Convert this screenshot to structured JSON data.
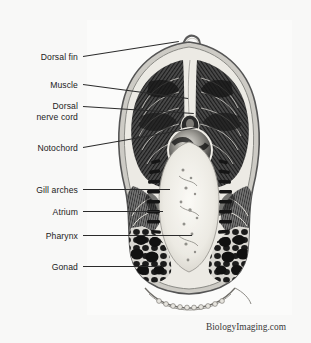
{
  "figure": {
    "title_credit": "BiologyImaging.com",
    "frame": {
      "x": 87,
      "y": 20,
      "width": 205,
      "height": 295,
      "border_color": "#8d8d8d"
    },
    "background_color": "#f8f8f7",
    "specimen_description": "amphioxus-cross-section"
  },
  "labels": [
    {
      "id": "dorsal-fin",
      "text": "Dorsal fin",
      "lines": [
        "Dorsal fin"
      ],
      "y": 52,
      "text_right": 78,
      "leader_x1": 83,
      "leader_y1": 56,
      "leader_x2": 179,
      "leader_y2": 41
    },
    {
      "id": "muscle",
      "text": "Muscle",
      "lines": [
        "Muscle"
      ],
      "y": 80,
      "text_right": 78,
      "leader_x1": 83,
      "leader_y1": 84,
      "leader_x2": 188,
      "leader_y2": 98
    },
    {
      "id": "dorsal-nerve-cord",
      "text": "Dorsal nerve cord",
      "lines": [
        "Dorsal",
        "nerve cord"
      ],
      "y": 101,
      "text_right": 78,
      "leader_x1": 83,
      "leader_y1": 106,
      "leader_x2": 194,
      "leader_y2": 113
    },
    {
      "id": "notochord",
      "text": "Notochord",
      "lines": [
        "Notochord"
      ],
      "y": 143,
      "text_right": 78,
      "leader_x1": 83,
      "leader_y1": 147,
      "leader_x2": 197,
      "leader_y2": 127
    },
    {
      "id": "gill-arches",
      "text": "Gill arches",
      "lines": [
        "Gill arches"
      ],
      "y": 185,
      "text_right": 78,
      "leader_x1": 83,
      "leader_y1": 189,
      "leader_x2": 170,
      "leader_y2": 189
    },
    {
      "id": "atrium",
      "text": "Atrium",
      "lines": [
        "Atrium"
      ],
      "y": 207,
      "text_right": 78,
      "leader_x1": 83,
      "leader_y1": 211,
      "leader_x2": 163,
      "leader_y2": 211
    },
    {
      "id": "pharynx",
      "text": "Pharynx",
      "lines": [
        "Pharynx"
      ],
      "y": 231,
      "text_right": 78,
      "leader_x1": 83,
      "leader_y1": 235,
      "leader_x2": 192,
      "leader_y2": 235
    },
    {
      "id": "gonad",
      "text": "Gonad",
      "lines": [
        "Gonad"
      ],
      "y": 262,
      "text_right": 78,
      "leader_x1": 83,
      "leader_y1": 266,
      "leader_x2": 160,
      "leader_y2": 266
    }
  ]
}
